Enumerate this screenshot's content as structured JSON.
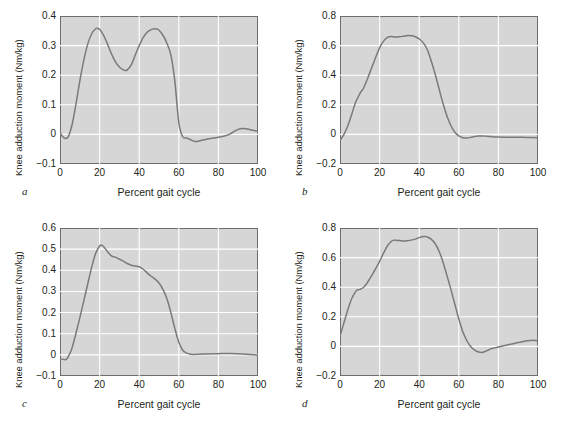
{
  "figure": {
    "background_color": "#ffffff",
    "plot_background_color": "#d6d6d6",
    "grid_color": "#ffffff",
    "line_color": "#7a7a7a",
    "axis_color": "#6e6e6e",
    "panel_count": 4
  },
  "chart_data": [
    {
      "type": "line",
      "panel_letter": "a",
      "title": "",
      "xlabel": "Percent gait cycle",
      "ylabel": "Knee adduction moment (Nm/kg)",
      "xlim": [
        0,
        100
      ],
      "ylim": [
        -0.1,
        0.4
      ],
      "xticks": [
        0,
        20,
        40,
        60,
        80,
        100
      ],
      "yticks": [
        0.4,
        0.3,
        0.2,
        0.1,
        0,
        -0.1
      ],
      "ytick_labels": [
        "0.4",
        "0.3",
        "0.2",
        "0.1",
        "0",
        "−0.1"
      ],
      "xtick_labels": [
        "0",
        "20",
        "40",
        "60",
        "80",
        "100"
      ],
      "grid": true,
      "legend": "none",
      "x": [
        0,
        2,
        4,
        6,
        8,
        10,
        12,
        14,
        16,
        18,
        19,
        20,
        22,
        24,
        26,
        28,
        30,
        32,
        33,
        34,
        36,
        38,
        40,
        42,
        44,
        46,
        48,
        49,
        50,
        52,
        54,
        56,
        58,
        60,
        62,
        64,
        66,
        68,
        70,
        72,
        74,
        76,
        78,
        80,
        82,
        84,
        86,
        88,
        90,
        92,
        94,
        96,
        98,
        100
      ],
      "y": [
        0.005,
        -0.012,
        -0.01,
        0.03,
        0.1,
        0.18,
        0.25,
        0.305,
        0.34,
        0.357,
        0.358,
        0.355,
        0.335,
        0.305,
        0.272,
        0.245,
        0.228,
        0.218,
        0.216,
        0.218,
        0.235,
        0.268,
        0.3,
        0.327,
        0.345,
        0.354,
        0.357,
        0.356,
        0.352,
        0.335,
        0.308,
        0.268,
        0.18,
        0.04,
        -0.008,
        -0.012,
        -0.018,
        -0.024,
        -0.023,
        -0.019,
        -0.016,
        -0.014,
        -0.012,
        -0.01,
        -0.007,
        -0.004,
        0.002,
        0.01,
        0.017,
        0.02,
        0.019,
        0.016,
        0.013,
        0.011
      ]
    },
    {
      "type": "line",
      "panel_letter": "b",
      "title": "",
      "xlabel": "Percent gait cycle",
      "ylabel": "Knee adduction moment (Nm/kg)",
      "xlim": [
        0,
        100
      ],
      "ylim": [
        -0.2,
        0.8
      ],
      "xticks": [
        0,
        20,
        40,
        60,
        80,
        100
      ],
      "yticks": [
        0.8,
        0.6,
        0.4,
        0.2,
        0,
        -0.2
      ],
      "ytick_labels": [
        "0.8",
        "0.6",
        "0.4",
        "0.2",
        "0",
        "−0.2"
      ],
      "xtick_labels": [
        "0",
        "20",
        "40",
        "60",
        "80",
        "100"
      ],
      "grid": true,
      "legend": "none",
      "x": [
        0,
        2,
        4,
        6,
        8,
        10,
        11,
        12,
        14,
        16,
        18,
        20,
        22,
        24,
        25,
        26,
        28,
        30,
        32,
        34,
        35,
        36,
        38,
        40,
        42,
        44,
        46,
        48,
        50,
        52,
        54,
        56,
        58,
        60,
        62,
        64,
        66,
        68,
        70,
        72,
        74,
        76,
        78,
        80,
        84,
        88,
        92,
        96,
        100
      ],
      "y": [
        -0.04,
        0.0,
        0.06,
        0.14,
        0.22,
        0.275,
        0.295,
        0.315,
        0.38,
        0.45,
        0.52,
        0.585,
        0.63,
        0.655,
        0.66,
        0.661,
        0.658,
        0.659,
        0.663,
        0.668,
        0.669,
        0.667,
        0.66,
        0.645,
        0.62,
        0.575,
        0.5,
        0.41,
        0.31,
        0.21,
        0.125,
        0.06,
        0.015,
        -0.01,
        -0.022,
        -0.025,
        -0.02,
        -0.014,
        -0.011,
        -0.01,
        -0.012,
        -0.015,
        -0.017,
        -0.018,
        -0.019,
        -0.02,
        -0.02,
        -0.021,
        -0.022
      ]
    },
    {
      "type": "line",
      "panel_letter": "c",
      "title": "",
      "xlabel": "Percent gait cycle",
      "ylabel": "Knee adduction moment (Nm/kg)",
      "xlim": [
        0,
        100
      ],
      "ylim": [
        -0.1,
        0.6
      ],
      "xticks": [
        0,
        20,
        40,
        60,
        80,
        100
      ],
      "yticks": [
        0.6,
        0.5,
        0.4,
        0.3,
        0.2,
        0.1,
        0,
        -0.1
      ],
      "ytick_labels": [
        "0.6",
        "0.5",
        "0.4",
        "0.3",
        "0.2",
        "0.1",
        "0",
        "−0.1"
      ],
      "xtick_labels": [
        "0",
        "20",
        "40",
        "60",
        "80",
        "100"
      ],
      "grid": true,
      "legend": "none",
      "x": [
        0,
        2,
        3,
        4,
        6,
        8,
        10,
        12,
        14,
        16,
        18,
        20,
        21,
        22,
        24,
        26,
        27,
        28,
        30,
        32,
        34,
        36,
        38,
        40,
        42,
        44,
        46,
        48,
        50,
        52,
        54,
        56,
        58,
        60,
        62,
        64,
        66,
        68,
        70,
        74,
        78,
        82,
        86,
        90,
        94,
        98,
        100
      ],
      "y": [
        -0.018,
        -0.022,
        -0.022,
        -0.012,
        0.03,
        0.1,
        0.175,
        0.255,
        0.335,
        0.415,
        0.48,
        0.515,
        0.519,
        0.513,
        0.488,
        0.468,
        0.464,
        0.462,
        0.452,
        0.443,
        0.432,
        0.424,
        0.42,
        0.417,
        0.405,
        0.388,
        0.372,
        0.358,
        0.34,
        0.31,
        0.265,
        0.2,
        0.125,
        0.06,
        0.022,
        0.008,
        0.003,
        0.002,
        0.003,
        0.004,
        0.005,
        0.006,
        0.006,
        0.005,
        0.003,
        0.0,
        -0.002
      ]
    },
    {
      "type": "line",
      "panel_letter": "d",
      "title": "",
      "xlabel": "Percent gait cycle",
      "ylabel": "Knee adduction moment (Nm/kg)",
      "xlim": [
        0,
        100
      ],
      "ylim": [
        -0.2,
        0.8
      ],
      "xticks": [
        0,
        20,
        40,
        60,
        80,
        100
      ],
      "yticks": [
        0.8,
        0.6,
        0.4,
        0.2,
        0,
        -0.2
      ],
      "ytick_labels": [
        "0.8",
        "0.6",
        "0.4",
        "0.2",
        "0",
        "−0.2"
      ],
      "xtick_labels": [
        "0",
        "20",
        "40",
        "60",
        "80",
        "100"
      ],
      "grid": true,
      "legend": "none",
      "x": [
        0,
        2,
        4,
        6,
        8,
        9,
        10,
        12,
        14,
        16,
        18,
        20,
        22,
        24,
        26,
        27,
        28,
        30,
        32,
        34,
        36,
        38,
        40,
        42,
        43,
        44,
        46,
        48,
        50,
        52,
        54,
        56,
        58,
        60,
        62,
        64,
        66,
        68,
        70,
        72,
        74,
        76,
        78,
        80,
        84,
        88,
        92,
        96,
        98,
        100
      ],
      "y": [
        0.07,
        0.16,
        0.25,
        0.325,
        0.372,
        0.382,
        0.385,
        0.4,
        0.435,
        0.478,
        0.525,
        0.575,
        0.63,
        0.68,
        0.71,
        0.717,
        0.718,
        0.715,
        0.712,
        0.714,
        0.718,
        0.725,
        0.735,
        0.742,
        0.743,
        0.74,
        0.725,
        0.695,
        0.645,
        0.57,
        0.48,
        0.385,
        0.285,
        0.185,
        0.1,
        0.04,
        0.0,
        -0.025,
        -0.038,
        -0.04,
        -0.03,
        -0.018,
        -0.01,
        -0.004,
        0.008,
        0.02,
        0.032,
        0.04,
        0.042,
        0.038
      ]
    }
  ]
}
